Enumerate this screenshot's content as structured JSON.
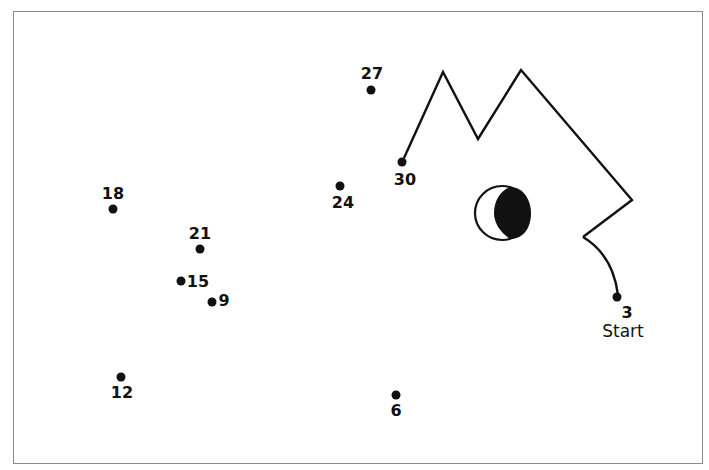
{
  "worksheet": {
    "type": "connect-the-dots",
    "start_label": "Start",
    "dots": [
      {
        "label": "3",
        "x": 617,
        "y": 297,
        "lx": 627,
        "ly": 313
      },
      {
        "label": "6",
        "x": 396,
        "y": 395,
        "lx": 396,
        "ly": 411
      },
      {
        "label": "9",
        "x": 212,
        "y": 302,
        "lx": 224,
        "ly": 301
      },
      {
        "label": "12",
        "x": 121,
        "y": 377,
        "lx": 122,
        "ly": 393
      },
      {
        "label": "15",
        "x": 181,
        "y": 281,
        "lx": 198,
        "ly": 282
      },
      {
        "label": "18",
        "x": 113,
        "y": 209,
        "lx": 113,
        "ly": 194
      },
      {
        "label": "21",
        "x": 200,
        "y": 249,
        "lx": 200,
        "ly": 234
      },
      {
        "label": "24",
        "x": 340,
        "y": 186,
        "lx": 343,
        "ly": 203
      },
      {
        "label": "27",
        "x": 371,
        "y": 90,
        "lx": 372,
        "ly": 74
      },
      {
        "label": "30",
        "x": 402,
        "y": 162,
        "lx": 405,
        "ly": 180
      }
    ],
    "colors": {
      "ink": "#111111",
      "border": "#8a8a8a",
      "paper": "#ffffff"
    }
  }
}
